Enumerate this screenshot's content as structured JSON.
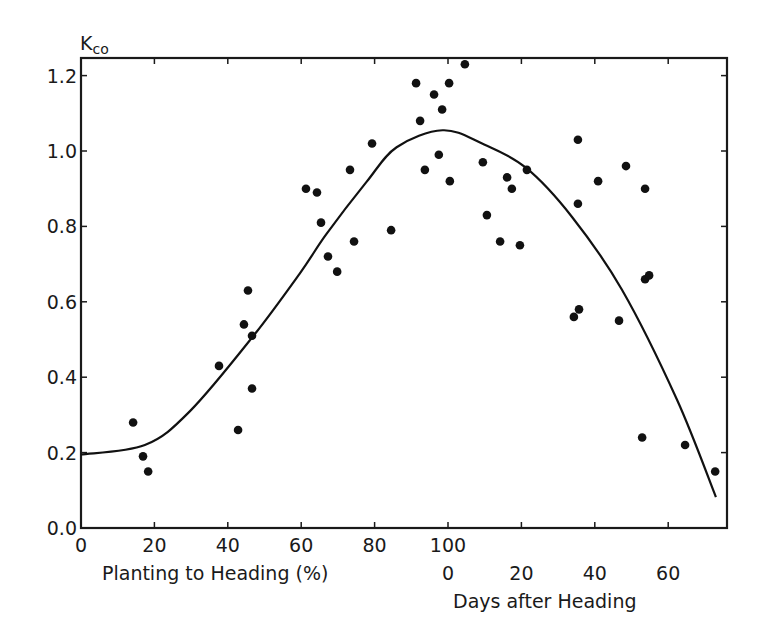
{
  "chart_data": {
    "type": "scatter",
    "title": "",
    "ylabel": "Kco",
    "ylabel_main": "K",
    "ylabel_sub": "co",
    "ylim": [
      0.0,
      1.25
    ],
    "yticks": [
      "0.0",
      "0.2",
      "0.4",
      "0.6",
      "0.8",
      "1.0",
      "1.2"
    ],
    "ytick_values": [
      0.0,
      0.2,
      0.4,
      0.6,
      0.8,
      1.0,
      1.2
    ],
    "xlim": [
      0,
      176
    ],
    "xaxis_primary": {
      "label": "Planting to Heading (%)",
      "ticks": [
        "0",
        "20",
        "40",
        "60",
        "80",
        "100"
      ],
      "tick_positions": [
        0,
        20,
        40,
        60,
        80,
        100
      ]
    },
    "xaxis_secondary": {
      "label": "Days after Heading",
      "ticks": [
        "0",
        "20",
        "40",
        "60"
      ],
      "tick_positions": [
        100,
        120,
        140,
        160
      ],
      "note": "Days after heading d plotted at position 100 + d"
    },
    "grid": false,
    "legend": null,
    "series": [
      {
        "name": "Observed Kco",
        "kind": "scatter",
        "color": "#111111",
        "points": [
          [
            14.2,
            0.28
          ],
          [
            16.9,
            0.19
          ],
          [
            18.3,
            0.15
          ],
          [
            37.6,
            0.43
          ],
          [
            42.8,
            0.26
          ],
          [
            44.4,
            0.54
          ],
          [
            45.5,
            0.63
          ],
          [
            46.6,
            0.51
          ],
          [
            46.6,
            0.37
          ],
          [
            61.3,
            0.9
          ],
          [
            64.3,
            0.89
          ],
          [
            65.4,
            0.81
          ],
          [
            67.3,
            0.72
          ],
          [
            69.8,
            0.68
          ],
          [
            73.3,
            0.95
          ],
          [
            74.4,
            0.76
          ],
          [
            79.3,
            1.02
          ],
          [
            84.5,
            0.79
          ],
          [
            91.3,
            1.18
          ],
          [
            92.4,
            1.08
          ],
          [
            93.7,
            0.95
          ],
          [
            96.2,
            1.15
          ],
          [
            97.5,
            0.99
          ],
          [
            98.4,
            1.11
          ],
          [
            100.3,
            1.18
          ],
          [
            100.5,
            0.92
          ],
          [
            104.6,
            1.23
          ],
          [
            109.5,
            0.97
          ],
          [
            110.6,
            0.83
          ],
          [
            114.2,
            0.76
          ],
          [
            116.1,
            0.93
          ],
          [
            117.4,
            0.9
          ],
          [
            119.6,
            0.75
          ],
          [
            121.5,
            0.95
          ],
          [
            134.3,
            0.56
          ],
          [
            135.7,
            0.58
          ],
          [
            135.4,
            1.03
          ],
          [
            135.4,
            0.86
          ],
          [
            140.9,
            0.92
          ],
          [
            146.6,
            0.55
          ],
          [
            148.5,
            0.96
          ],
          [
            152.9,
            0.24
          ],
          [
            153.7,
            0.9
          ],
          [
            153.7,
            0.66
          ],
          [
            154.8,
            0.67
          ],
          [
            164.6,
            0.22
          ],
          [
            172.8,
            0.15
          ]
        ]
      },
      {
        "name": "Fitted curve",
        "kind": "line",
        "color": "#111111",
        "points": [
          [
            0,
            0.195
          ],
          [
            17.4,
            0.22
          ],
          [
            29.7,
            0.31
          ],
          [
            46.6,
            0.505
          ],
          [
            59.6,
            0.675
          ],
          [
            66.9,
            0.78
          ],
          [
            77.8,
            0.918
          ],
          [
            86.0,
            1.01
          ],
          [
            98.5,
            1.055
          ],
          [
            109.3,
            1.02
          ],
          [
            121.3,
            0.955
          ],
          [
            133.8,
            0.825
          ],
          [
            147.4,
            0.632
          ],
          [
            162.4,
            0.34
          ],
          [
            173.0,
            0.082
          ]
        ]
      }
    ]
  }
}
